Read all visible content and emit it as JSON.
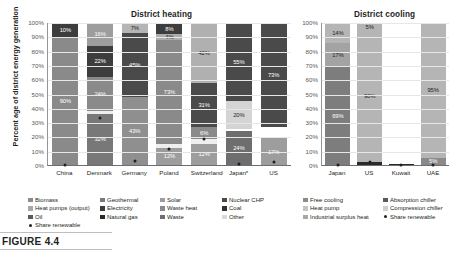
{
  "figure": {
    "caption": "FIGURE 4.4",
    "ylabel": "Percent age of district energy generation"
  },
  "chart_data": [
    {
      "type": "bar",
      "title": "District heating",
      "stacked": true,
      "xlabel": "",
      "ylabel": "Percent age of district energy generation",
      "ylim": [
        0,
        100
      ],
      "yticks": [
        "0%",
        "10%",
        "20%",
        "30%",
        "40%",
        "50%",
        "60%",
        "70%",
        "80%",
        "90%",
        "100%"
      ],
      "grid": true,
      "legend_position": "below",
      "categories": [
        "China",
        "Denmark",
        "Germany",
        "Poland",
        "Switzerland",
        "Japan*",
        "US"
      ],
      "series": [
        {
          "name": "Biomass",
          "color": "#8c8c8c",
          "values": [
            0,
            0,
            0,
            0,
            0,
            0,
            0
          ]
        },
        {
          "name": "Heat pumps (output)",
          "color": "#d9d9d9",
          "values": [
            0,
            0,
            0,
            0,
            0,
            20,
            0
          ]
        },
        {
          "name": "Oil",
          "color": "#595959",
          "values": [
            0,
            0,
            0,
            0,
            0,
            0,
            0
          ]
        },
        {
          "name": "Geothermal",
          "color": "#a6a6a6",
          "values": [
            0,
            0,
            0,
            0,
            0,
            0,
            0
          ]
        },
        {
          "name": "Electricity",
          "color": "#404040",
          "values": [
            0,
            0,
            0,
            0,
            0,
            0,
            0
          ]
        },
        {
          "name": "Natural gas",
          "color": "#808080",
          "values": [
            90,
            24,
            43,
            73,
            31,
            55,
            73
          ]
        },
        {
          "name": "Solar",
          "color": "#bfbfbf",
          "values": [
            0,
            0,
            7,
            4,
            42,
            0,
            0
          ]
        },
        {
          "name": "Waste heat",
          "color": "#737373",
          "values": [
            0,
            0,
            0,
            0,
            6,
            0,
            0
          ]
        },
        {
          "name": "Waste",
          "color": "#999999",
          "values": [
            0,
            32,
            0,
            12,
            12,
            24,
            17
          ]
        },
        {
          "name": "Nuclear CHP",
          "color": "#4d4d4d",
          "values": [
            0,
            0,
            0,
            0,
            0,
            0,
            0
          ]
        },
        {
          "name": "Coal",
          "color": "#333333",
          "values": [
            10,
            22,
            45,
            8,
            0,
            0,
            0
          ]
        },
        {
          "name": "Other",
          "color": "#f2f2f2",
          "values": [
            0,
            0,
            0,
            0,
            0,
            0,
            0
          ]
        }
      ],
      "bars": [
        {
          "category": "China",
          "share_renewable_pct": 0,
          "segments": [
            {
              "label": "10%",
              "value": 10,
              "color": "#3d3d3d",
              "label_color": "light"
            },
            {
              "label": "90%",
              "value": 90,
              "color": "#8a8a8a",
              "label_color": "light"
            }
          ]
        },
        {
          "category": "Denmark",
          "share_renewable_pct": 33,
          "segments": [
            {
              "label": "16%",
              "value": 16,
              "color": "#9d9d9d",
              "label_color": "light"
            },
            {
              "label": "22%",
              "value": 22,
              "color": "#3d3d3d",
              "label_color": "light"
            },
            {
              "label": "24%",
              "value": 24,
              "color": "#8a8a8a",
              "label_color": "light"
            },
            {
              "label": "",
              "value": 2,
              "color": "#ededed",
              "label_color": "dark"
            },
            {
              "label": "32%",
              "value": 36,
              "color": "#787878",
              "label_color": "light"
            }
          ]
        },
        {
          "category": "Germany",
          "share_renewable_pct": 3,
          "segments": [
            {
              "label": "7%",
              "value": 7,
              "color": "#b5b5b5",
              "label_color": "dark"
            },
            {
              "label": "45%",
              "value": 45,
              "color": "#4a4a4a",
              "label_color": "light"
            },
            {
              "label": "43%",
              "value": 48,
              "color": "#8f8f8f",
              "label_color": "light"
            }
          ]
        },
        {
          "category": "Poland",
          "share_renewable_pct": 11,
          "segments": [
            {
              "label": "8%",
              "value": 8,
              "color": "#3d3d3d",
              "label_color": "light"
            },
            {
              "label": "4%",
              "value": 4,
              "color": "#adadad",
              "label_color": "dark"
            },
            {
              "label": "73%",
              "value": 73,
              "color": "#8a8a8a",
              "label_color": "light"
            },
            {
              "label": "",
              "value": 3,
              "color": "#efefef",
              "label_color": "dark"
            },
            {
              "label": "12%",
              "value": 12,
              "color": "#9d9d9d",
              "label_color": "light"
            }
          ]
        },
        {
          "category": "Switzerland",
          "share_renewable_pct": 18,
          "segments": [
            {
              "label": "42%",
              "value": 42,
              "color": "#b0b0b0",
              "label_color": "dark"
            },
            {
              "label": "31%",
              "value": 31,
              "color": "#4a4a4a",
              "label_color": "light"
            },
            {
              "label": "6%",
              "value": 9,
              "color": "#8a8a8a",
              "label_color": "light"
            },
            {
              "label": "",
              "value": 3,
              "color": "#efefef",
              "label_color": "dark"
            },
            {
              "label": "12%",
              "value": 15,
              "color": "#9d9d9d",
              "label_color": "light"
            }
          ]
        },
        {
          "category": "Japan*",
          "share_renewable_pct": 1,
          "segments": [
            {
              "label": "55%",
              "value": 55,
              "color": "#4a4a4a",
              "label_color": "light"
            },
            {
              "label": "20%",
              "value": 20,
              "color": "#d4d4d4",
              "label_color": "dark"
            },
            {
              "label": "",
              "value": 1,
              "color": "#ffffff",
              "label_color": "dark"
            },
            {
              "label": "24%",
              "value": 24,
              "color": "#6e6e6e",
              "label_color": "light"
            }
          ]
        },
        {
          "category": "US",
          "share_renewable_pct": 2,
          "segments": [
            {
              "label": "73%",
              "value": 73,
              "color": "#4a4a4a",
              "label_color": "light"
            },
            {
              "label": "",
              "value": 8,
              "color": "#ffffff",
              "label_color": "dark"
            },
            {
              "label": "17%",
              "value": 19,
              "color": "#9d9d9d",
              "label_color": "light"
            }
          ]
        }
      ],
      "legend": [
        [
          {
            "label": "Biomass",
            "color": "#8c8c8c",
            "shape": "square"
          },
          {
            "label": "Heat pumps (output)",
            "color": "#a8a8a8",
            "shape": "square"
          },
          {
            "label": "Oil",
            "color": "#5a5a5a",
            "shape": "square"
          },
          {
            "label": "Share renewable",
            "color": "#231f20",
            "shape": "dot"
          }
        ],
        [
          {
            "label": "Geothermal",
            "color": "#7a7a7a",
            "shape": "square"
          },
          {
            "label": "Electricity",
            "color": "#3d3d3d",
            "shape": "square"
          },
          {
            "label": "Natural gas",
            "color": "#2b2b2b",
            "shape": "square"
          }
        ],
        [
          {
            "label": "Solar",
            "color": "#9d9d9d",
            "shape": "square"
          },
          {
            "label": "Waste heat",
            "color": "#8a8a8a",
            "shape": "square"
          },
          {
            "label": "Waste",
            "color": "#6e6e6e",
            "shape": "square"
          }
        ],
        [
          {
            "label": "Nuclear CHP",
            "color": "#4a4a4a",
            "shape": "square"
          },
          {
            "label": "Coal",
            "color": "#333333",
            "shape": "square"
          },
          {
            "label": "Other",
            "color": "#d9d9d9",
            "shape": "square"
          }
        ]
      ]
    },
    {
      "type": "bar",
      "title": "District cooling",
      "stacked": true,
      "xlabel": "",
      "ylabel": "",
      "ylim": [
        0,
        100
      ],
      "yticks": [
        "0%",
        "10%",
        "20%",
        "30%",
        "40%",
        "50%",
        "60%",
        "70%",
        "80%",
        "90%",
        "100%"
      ],
      "grid": true,
      "legend_position": "below",
      "categories": [
        "Japan",
        "US",
        "Kuwait",
        "UAE"
      ],
      "series": [
        {
          "name": "Free cooling",
          "color": "#bfbfbf",
          "values": [
            14,
            0,
            0,
            0
          ]
        },
        {
          "name": "Heat pump",
          "color": "#d9d9d9",
          "values": [
            0,
            0,
            0,
            0
          ]
        },
        {
          "name": "Industrial surplus heat",
          "color": "#a6a6a6",
          "values": [
            17,
            0,
            0,
            0
          ]
        },
        {
          "name": "Absorption chiller",
          "color": "#9e9e9e",
          "values": [
            0,
            5,
            0,
            5
          ]
        },
        {
          "name": "Compression chiller",
          "color": "#7a7a7a",
          "values": [
            69,
            90,
            0,
            95
          ]
        }
      ],
      "bars": [
        {
          "category": "Japan",
          "share_renewable_pct": 0,
          "segments": [
            {
              "label": "14%",
              "value": 14,
              "color": "#b5b5b5",
              "label_color": "dark"
            },
            {
              "label": "17%",
              "value": 17,
              "color": "#a3a3a3",
              "label_color": "dark"
            },
            {
              "label": "69%",
              "value": 69,
              "color": "#7d7d7d",
              "label_color": "light"
            }
          ]
        },
        {
          "category": "US",
          "share_renewable_pct": 2,
          "segments": [
            {
              "label": "5%",
              "value": 5,
              "color": "#b5b5b5",
              "label_color": "dark"
            },
            {
              "label": "90%",
              "value": 93,
              "color": "#b5b5b5",
              "label_color": "dark"
            },
            {
              "label": "",
              "value": 2,
              "color": "#2b2b2b",
              "label_color": "light"
            }
          ]
        },
        {
          "category": "Kuwait",
          "share_renewable_pct": 0,
          "segments": [
            {
              "label": "",
              "value": 99,
              "color": "#ffffff",
              "label_color": "dark"
            },
            {
              "label": "",
              "value": 1,
              "color": "#2b2b2b",
              "label_color": "light"
            }
          ]
        },
        {
          "category": "UAE",
          "share_renewable_pct": 0,
          "segments": [
            {
              "label": "95%",
              "value": 95,
              "color": "#b5b5b5",
              "label_color": "dark"
            },
            {
              "label": "5%",
              "value": 5,
              "color": "#8a8a8a",
              "label_color": "light"
            }
          ]
        }
      ],
      "legend": [
        [
          {
            "label": "Free cooling",
            "color": "#8c8c8c",
            "shape": "square"
          },
          {
            "label": "Heat pump",
            "color": "#c4c4c4",
            "shape": "square"
          },
          {
            "label": "Industrial surplus heat",
            "color": "#a8a8a8",
            "shape": "square"
          }
        ],
        [
          {
            "label": "Absorption chiller",
            "color": "#5a5a5a",
            "shape": "square"
          },
          {
            "label": "Compression chiller",
            "color": "#d0d0d0",
            "shape": "square"
          },
          {
            "label": "Share renewable",
            "color": "#231f20",
            "shape": "dot"
          }
        ]
      ]
    }
  ]
}
